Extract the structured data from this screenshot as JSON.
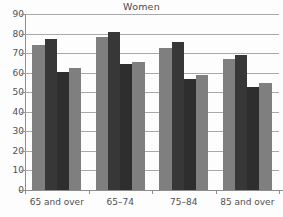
{
  "chart_data": {
    "type": "bar",
    "title": "Women",
    "xlabel": "",
    "ylabel": "",
    "ylim": [
      0,
      90
    ],
    "ytick_step": 10,
    "yticks": [
      0,
      10,
      20,
      30,
      40,
      50,
      60,
      70,
      80,
      90
    ],
    "grid": true,
    "legend": "none",
    "categories": [
      "65 and over",
      "65–74",
      "75–84",
      "85 and over"
    ],
    "series": [
      {
        "name": "Series 1",
        "color": "#7f7f7f",
        "values": [
          74,
          78,
          72.5,
          67
        ]
      },
      {
        "name": "Series 2",
        "color": "#373737",
        "values": [
          77,
          81,
          75.5,
          69
        ]
      },
      {
        "name": "Series 3",
        "color": "#2e2e2e",
        "values": [
          60.5,
          64.5,
          57,
          52.5
        ]
      },
      {
        "name": "Series 4",
        "color": "#7f7f7f",
        "values": [
          62.5,
          65.5,
          59,
          54.5
        ]
      }
    ]
  },
  "axis": {
    "y_tick_labels": [
      "90",
      "80",
      "70",
      "60",
      "50",
      "40",
      "30",
      "20",
      "10",
      "0"
    ],
    "x_tick_labels": [
      "65 and over",
      "65–74",
      "75–84",
      "85 and over"
    ]
  }
}
